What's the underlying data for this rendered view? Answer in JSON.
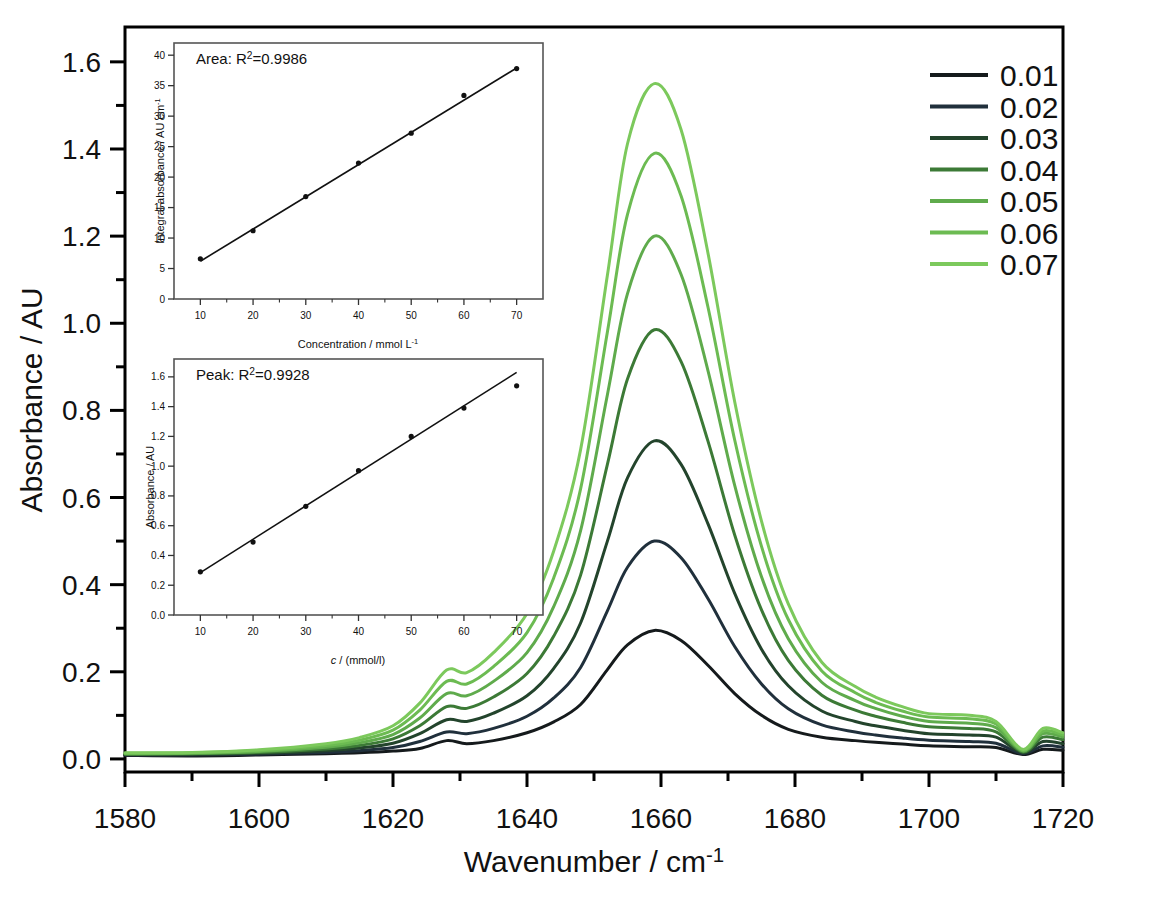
{
  "figure": {
    "background": "#ffffff",
    "frame_color": "#000000"
  },
  "main_axes": {
    "y_axis_label": "Absorbance / AU",
    "x_axis_label_main": "Wavenumber / cm",
    "x_axis_label_sup": "-1",
    "x_ticks": [
      "1580",
      "1600",
      "1620",
      "1640",
      "1660",
      "1680",
      "1700",
      "1720"
    ],
    "y_ticks": [
      "0.0",
      "0.2",
      "0.4",
      "0.6",
      "0.8",
      "1.0",
      "1.2",
      "1.4",
      "1.6"
    ]
  },
  "legend": {
    "entries": [
      {
        "label": "0.01",
        "color": "#151a1c"
      },
      {
        "label": "0.02",
        "color": "#20303c"
      },
      {
        "label": "0.03",
        "color": "#23442c"
      },
      {
        "label": "0.04",
        "color": "#3c7a36"
      },
      {
        "label": "0.05",
        "color": "#5fab4c"
      },
      {
        "label": "0.06",
        "color": "#6cbb52"
      },
      {
        "label": "0.07",
        "color": "#7cc95c"
      }
    ]
  },
  "inset_area": {
    "title_main": "Area: R",
    "title_sup": "2",
    "title_tail": "=0.9986",
    "y_axis_label_main": "Integral absorbance / AU cm",
    "y_axis_label_sup": "-1",
    "x_axis_label_main": "Concentration / mmol L",
    "x_axis_label_sup": "-1",
    "x_ticks": [
      "10",
      "20",
      "30",
      "40",
      "50",
      "60",
      "70"
    ],
    "y_ticks": [
      "0",
      "5",
      "10",
      "15",
      "20",
      "25",
      "30",
      "35",
      "40"
    ]
  },
  "inset_peak": {
    "title_main": "Peak: R",
    "title_sup": "2",
    "title_tail": "=0.9928",
    "y_axis_label": "Absorbance / AU",
    "x_axis_label_italic": "c",
    "x_axis_label_rest": " / (mmol/l)",
    "x_ticks": [
      "10",
      "20",
      "30",
      "40",
      "50",
      "60",
      "70"
    ],
    "y_ticks": [
      "0.0",
      "0.2",
      "0.4",
      "0.6",
      "0.8",
      "1.0",
      "1.2",
      "1.4",
      "1.6"
    ]
  },
  "chart_data": [
    {
      "type": "line",
      "name": "ftir-spectra-main",
      "title": "",
      "xlabel": "Wavenumber / cm^-1",
      "ylabel": "Absorbance / AU",
      "xlim": [
        1580,
        1720
      ],
      "ylim": [
        -0.03,
        1.68
      ],
      "grid": false,
      "legend_position": "outside-right-top",
      "legend_title": "",
      "x_major_step": 20,
      "x_minor_step": 10,
      "y_major_step": 0.2,
      "y_minor_step": 0.1,
      "peak_center": 1659,
      "shoulder_center": 1628,
      "series": [
        {
          "name": "0.01",
          "color": "#151a1c",
          "peak_height": 0.295,
          "x": [
            1580,
            1590,
            1600,
            1610,
            1615,
            1620,
            1624,
            1628,
            1631,
            1635,
            1640,
            1644,
            1648,
            1652,
            1655,
            1659,
            1663,
            1667,
            1671,
            1675,
            1679,
            1684,
            1689,
            1692,
            1696,
            1700,
            1706,
            1710,
            1714,
            1717,
            1720
          ],
          "y": [
            0.008,
            0.007,
            0.009,
            0.012,
            0.014,
            0.018,
            0.024,
            0.042,
            0.035,
            0.042,
            0.06,
            0.085,
            0.125,
            0.205,
            0.262,
            0.295,
            0.272,
            0.215,
            0.15,
            0.1,
            0.068,
            0.05,
            0.042,
            0.038,
            0.034,
            0.03,
            0.028,
            0.026,
            0.01,
            0.022,
            0.02
          ]
        },
        {
          "name": "0.02",
          "color": "#20303c",
          "peak_height": 0.5,
          "x": [
            1580,
            1590,
            1600,
            1610,
            1615,
            1620,
            1624,
            1628,
            1631,
            1635,
            1640,
            1644,
            1648,
            1652,
            1655,
            1659,
            1663,
            1667,
            1671,
            1675,
            1679,
            1684,
            1689,
            1692,
            1696,
            1700,
            1706,
            1710,
            1714,
            1717,
            1720
          ],
          "y": [
            0.009,
            0.009,
            0.011,
            0.015,
            0.019,
            0.026,
            0.04,
            0.062,
            0.058,
            0.07,
            0.098,
            0.14,
            0.21,
            0.34,
            0.44,
            0.5,
            0.462,
            0.368,
            0.258,
            0.172,
            0.115,
            0.078,
            0.062,
            0.055,
            0.048,
            0.043,
            0.04,
            0.036,
            0.012,
            0.03,
            0.027
          ]
        },
        {
          "name": "0.03",
          "color": "#23442c",
          "peak_height": 0.73,
          "x": [
            1580,
            1590,
            1600,
            1610,
            1615,
            1620,
            1624,
            1628,
            1631,
            1635,
            1640,
            1644,
            1648,
            1652,
            1655,
            1659,
            1663,
            1667,
            1671,
            1675,
            1679,
            1684,
            1689,
            1692,
            1696,
            1700,
            1706,
            1710,
            1714,
            1717,
            1720
          ],
          "y": [
            0.01,
            0.01,
            0.013,
            0.019,
            0.025,
            0.036,
            0.058,
            0.09,
            0.086,
            0.105,
            0.145,
            0.208,
            0.312,
            0.5,
            0.645,
            0.73,
            0.676,
            0.54,
            0.38,
            0.252,
            0.168,
            0.11,
            0.086,
            0.076,
            0.066,
            0.058,
            0.055,
            0.05,
            0.014,
            0.04,
            0.035
          ]
        },
        {
          "name": "0.04",
          "color": "#3c7a36",
          "peak_height": 0.985,
          "x": [
            1580,
            1590,
            1600,
            1610,
            1615,
            1620,
            1624,
            1628,
            1631,
            1635,
            1640,
            1644,
            1648,
            1652,
            1655,
            1659,
            1663,
            1667,
            1671,
            1675,
            1679,
            1684,
            1689,
            1692,
            1696,
            1700,
            1706,
            1710,
            1714,
            1717,
            1720
          ],
          "y": [
            0.011,
            0.012,
            0.015,
            0.023,
            0.031,
            0.046,
            0.076,
            0.12,
            0.116,
            0.142,
            0.196,
            0.282,
            0.422,
            0.676,
            0.872,
            0.985,
            0.912,
            0.73,
            0.514,
            0.342,
            0.226,
            0.146,
            0.112,
            0.098,
            0.084,
            0.074,
            0.07,
            0.062,
            0.016,
            0.05,
            0.044
          ]
        },
        {
          "name": "0.05",
          "color": "#5fab4c",
          "peak_height": 1.2,
          "x": [
            1580,
            1590,
            1600,
            1610,
            1615,
            1620,
            1624,
            1628,
            1631,
            1635,
            1640,
            1644,
            1648,
            1652,
            1655,
            1659,
            1663,
            1667,
            1671,
            1675,
            1679,
            1684,
            1689,
            1692,
            1696,
            1700,
            1706,
            1710,
            1714,
            1717,
            1720
          ],
          "y": [
            0.012,
            0.013,
            0.017,
            0.027,
            0.037,
            0.056,
            0.094,
            0.15,
            0.145,
            0.178,
            0.244,
            0.35,
            0.524,
            0.836,
            1.068,
            1.2,
            1.112,
            0.892,
            0.628,
            0.418,
            0.276,
            0.176,
            0.134,
            0.116,
            0.098,
            0.086,
            0.082,
            0.072,
            0.018,
            0.058,
            0.05
          ]
        },
        {
          "name": "0.06",
          "color": "#6cbb52",
          "peak_height": 1.39,
          "x": [
            1580,
            1590,
            1600,
            1610,
            1615,
            1620,
            1624,
            1628,
            1631,
            1635,
            1640,
            1644,
            1648,
            1652,
            1655,
            1659,
            1663,
            1667,
            1671,
            1675,
            1679,
            1684,
            1689,
            1692,
            1696,
            1700,
            1706,
            1710,
            1714,
            1717,
            1720
          ],
          "y": [
            0.013,
            0.014,
            0.019,
            0.031,
            0.043,
            0.066,
            0.112,
            0.178,
            0.172,
            0.212,
            0.29,
            0.416,
            0.62,
            0.98,
            1.25,
            1.39,
            1.292,
            1.038,
            0.732,
            0.488,
            0.32,
            0.202,
            0.152,
            0.13,
            0.11,
            0.096,
            0.092,
            0.08,
            0.02,
            0.064,
            0.055
          ]
        },
        {
          "name": "0.07",
          "color": "#7cc95c",
          "peak_height": 1.55,
          "x": [
            1580,
            1590,
            1600,
            1610,
            1615,
            1620,
            1624,
            1628,
            1631,
            1635,
            1640,
            1644,
            1648,
            1652,
            1655,
            1659,
            1663,
            1667,
            1671,
            1675,
            1679,
            1684,
            1689,
            1692,
            1696,
            1700,
            1706,
            1710,
            1714,
            1717,
            1720
          ],
          "y": [
            0.014,
            0.015,
            0.021,
            0.035,
            0.049,
            0.076,
            0.128,
            0.204,
            0.198,
            0.244,
            0.334,
            0.478,
            0.71,
            1.11,
            1.412,
            1.55,
            1.444,
            1.162,
            0.82,
            0.546,
            0.356,
            0.222,
            0.166,
            0.142,
            0.12,
            0.104,
            0.1,
            0.086,
            0.022,
            0.07,
            0.06
          ]
        }
      ]
    },
    {
      "type": "scatter",
      "name": "inset-area-calibration",
      "title": "Area: R2=0.9986",
      "xlabel": "Concentration / mmol L^-1",
      "ylabel": "Integral absorbance / AU cm^-1",
      "xlim": [
        5,
        75
      ],
      "ylim": [
        0,
        42
      ],
      "grid": false,
      "r_squared": 0.9986,
      "x": [
        10,
        20,
        30,
        40,
        50,
        60,
        70
      ],
      "y": [
        6.6,
        11.2,
        16.8,
        22.3,
        27.2,
        33.4,
        37.8
      ],
      "fit_line": {
        "x": [
          10,
          70
        ],
        "y": [
          6.2,
          37.9
        ]
      }
    },
    {
      "type": "scatter",
      "name": "inset-peak-calibration",
      "title": "Peak: R2=0.9928",
      "xlabel": "c / (mmol/l)",
      "ylabel": "Absorbance / AU",
      "xlim": [
        5,
        75
      ],
      "ylim": [
        0,
        1.72
      ],
      "grid": false,
      "r_squared": 0.9928,
      "x": [
        10,
        20,
        30,
        40,
        50,
        60,
        70
      ],
      "y": [
        0.29,
        0.49,
        0.73,
        0.97,
        1.2,
        1.39,
        1.54
      ],
      "fit_line": {
        "x": [
          10,
          70
        ],
        "y": [
          0.285,
          1.63
        ]
      }
    }
  ]
}
